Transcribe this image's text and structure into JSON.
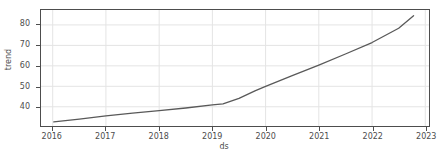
{
  "chart_data": {
    "type": "line",
    "title": "",
    "xlabel": "ds",
    "ylabel": "trend",
    "xlim": [
      2015.78,
      2023.07
    ],
    "ylim": [
      30.6,
      87.3
    ],
    "grid": true,
    "legend": null,
    "xticks": [
      2016,
      2017,
      2018,
      2019,
      2020,
      2021,
      2022,
      2023
    ],
    "xticklabels": [
      "2016",
      "2017",
      "2018",
      "2019",
      "2020",
      "2021",
      "2022",
      "2023"
    ],
    "yticks": [
      40,
      50,
      60,
      70,
      80
    ],
    "yticklabels": [
      "40",
      "50",
      "60",
      "70",
      "80"
    ],
    "line_color": "#595959",
    "line_width": 1.3,
    "grid_color": "#e4e4e4",
    "axis_color": "#4d4d4d",
    "background": "#ffffff",
    "series": [
      {
        "name": "trend",
        "x": [
          2016.02,
          2016.5,
          2017.0,
          2017.5,
          2018.0,
          2018.5,
          2019.0,
          2019.2,
          2019.5,
          2019.8,
          2020.0,
          2020.5,
          2021.0,
          2021.5,
          2022.0,
          2022.5,
          2022.78
        ],
        "y": [
          32.6,
          34.0,
          35.5,
          36.9,
          38.1,
          39.4,
          40.9,
          41.4,
          44.1,
          47.8,
          50.0,
          55.2,
          60.4,
          65.8,
          71.4,
          78.4,
          84.5
        ]
      }
    ]
  },
  "axis_titles": {
    "x": "ds",
    "y": "trend"
  }
}
